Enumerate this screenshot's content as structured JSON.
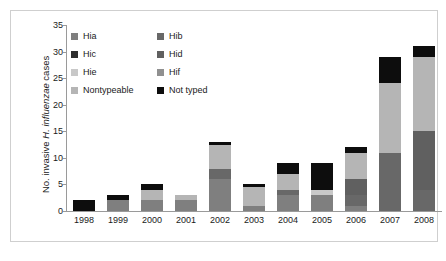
{
  "chart_data": {
    "type": "bar",
    "subtype": "stacked-bar",
    "title": "",
    "xlabel": "",
    "ylabel": "No. invasive H. influenzae cases",
    "ylabel_parts": {
      "prefix": "No. invasive ",
      "italic": "H. influenzae",
      "suffix": " cases"
    },
    "ylim": [
      0,
      35
    ],
    "ytick_step": 5,
    "yticks": [
      0,
      5,
      10,
      15,
      20,
      25,
      30,
      35
    ],
    "ytick_labels": [
      "0",
      "5",
      "10",
      "15",
      "20",
      "25",
      "30",
      "35"
    ],
    "grid": false,
    "legend_position": "upper-left-inside",
    "legend_columns": 2,
    "categories": [
      "1998",
      "1999",
      "2000",
      "2001",
      "2002",
      "2003",
      "2004",
      "2005",
      "2006",
      "2007",
      "2008"
    ],
    "series": [
      {
        "name": "Hia",
        "color": "#7f7f7f",
        "values": [
          0,
          2,
          2,
          2,
          6,
          1,
          3,
          3,
          1,
          0,
          0
        ]
      },
      {
        "name": "Hib",
        "color": "#686868",
        "values": [
          0,
          0,
          0,
          0,
          2,
          0,
          1,
          0,
          2,
          11,
          4
        ]
      },
      {
        "name": "Hic",
        "color": "#2e2e2e",
        "values": [
          0,
          0,
          0,
          0,
          0,
          0,
          0,
          0,
          0,
          0,
          0
        ]
      },
      {
        "name": "Hid",
        "color": "#606060",
        "values": [
          0,
          0,
          0,
          0,
          0,
          0,
          0,
          0,
          3,
          0,
          11
        ]
      },
      {
        "name": "Hie",
        "color": "#c8c8c8",
        "values": [
          0,
          0,
          0,
          0,
          0,
          0,
          0,
          1,
          0,
          0,
          0
        ]
      },
      {
        "name": "Hif",
        "color": "#909090",
        "values": [
          0,
          0,
          0,
          0,
          0,
          0,
          0,
          0,
          0,
          0,
          0
        ]
      },
      {
        "name": "Nontypeable",
        "color": "#b5b5b5",
        "values": [
          0,
          0,
          2,
          1,
          4.5,
          3.5,
          3,
          0,
          5,
          13,
          14
        ]
      },
      {
        "name": "Not typed",
        "color": "#0d0d0d",
        "values": [
          2,
          1,
          1,
          0,
          0.5,
          0.5,
          2,
          5,
          1,
          5,
          2
        ]
      }
    ],
    "totals": [
      2,
      3,
      5,
      3,
      13,
      5,
      9,
      9,
      12,
      29,
      31
    ],
    "stack_order_bottom_to_top": [
      "Hia",
      "Hib",
      "Hic",
      "Hid",
      "Hie",
      "Hif",
      "Nontypeable",
      "Not typed"
    ]
  },
  "legend": {
    "entries": [
      {
        "label": "Hia",
        "color": "#7f7f7f"
      },
      {
        "label": "Hib",
        "color": "#686868"
      },
      {
        "label": "Hic",
        "color": "#2e2e2e"
      },
      {
        "label": "Hid",
        "color": "#606060"
      },
      {
        "label": "Hie",
        "color": "#c8c8c8"
      },
      {
        "label": "Hif",
        "color": "#909090"
      },
      {
        "label": "Nontypeable",
        "color": "#b5b5b5"
      },
      {
        "label": "Not typed",
        "color": "#0d0d0d"
      }
    ]
  },
  "colors": {
    "axis": "#9a9a9a",
    "frame": "#cfcfcf",
    "text": "#1a1a1a",
    "background": "#ffffff"
  }
}
